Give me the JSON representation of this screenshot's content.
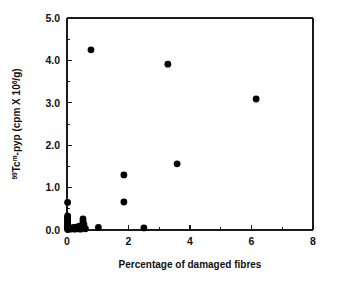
{
  "chart_data": {
    "type": "scatter",
    "title": "",
    "xlabel": "Percentage of damaged fibres",
    "ylabel_parts": {
      "sup_isotope": "99",
      "base1": "Tc",
      "sup_m": "m",
      "base2": "-pyp (cpm X 10",
      "sup_exp": "6",
      "base3": "/g)"
    },
    "ylabel": "99Tcm-pyp (cpm X 106/g)",
    "xlim": [
      0,
      8
    ],
    "ylim": [
      0,
      5
    ],
    "xticks": [
      0,
      2,
      4,
      6,
      8
    ],
    "xticklabels": [
      "0",
      "2",
      "4",
      "6",
      "8"
    ],
    "xticks_minor": [
      1,
      3,
      5,
      7
    ],
    "yticks": [
      0,
      1,
      2,
      3,
      4,
      5
    ],
    "yticklabels": [
      "0.0",
      "1.0",
      "2.0",
      "3.0",
      "4.0",
      "5.0"
    ],
    "yticks_minor": [
      0.5,
      1.5,
      2.5,
      3.5,
      4.5
    ],
    "grid": false,
    "legend": false,
    "marker_color": "#000000",
    "marker_size": 3.4,
    "points": [
      [
        0.78,
        4.25
      ],
      [
        3.28,
        3.91
      ],
      [
        6.15,
        3.09
      ],
      [
        3.58,
        1.56
      ],
      [
        1.85,
        1.3
      ],
      [
        1.85,
        0.66
      ],
      [
        0.02,
        0.65
      ],
      [
        0.52,
        0.26
      ],
      [
        0.52,
        0.2
      ],
      [
        0.55,
        0.13
      ],
      [
        0.4,
        0.09
      ],
      [
        0.3,
        0.07
      ],
      [
        0.22,
        0.06
      ],
      [
        1.02,
        0.06
      ],
      [
        2.5,
        0.05
      ],
      [
        0.12,
        0.05
      ],
      [
        0.06,
        0.04
      ],
      [
        0.02,
        0.33
      ],
      [
        0.02,
        0.3
      ],
      [
        0.02,
        0.27
      ],
      [
        0.02,
        0.24
      ],
      [
        0.02,
        0.21
      ],
      [
        0.02,
        0.18
      ],
      [
        0.02,
        0.15
      ],
      [
        0.02,
        0.12
      ],
      [
        0.02,
        0.09
      ],
      [
        0.02,
        0.06
      ],
      [
        0.02,
        0.03
      ],
      [
        0.02,
        0.01
      ],
      [
        0.09,
        0.02
      ],
      [
        0.16,
        0.03
      ],
      [
        0.25,
        0.02
      ],
      [
        0.34,
        0.03
      ],
      [
        0.44,
        0.02
      ],
      [
        0.6,
        0.03
      ]
    ]
  }
}
